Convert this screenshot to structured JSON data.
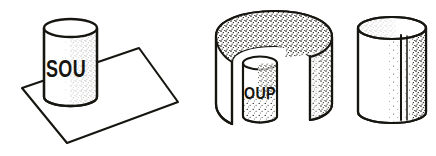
{
  "illustration": {
    "title": "Soup can label unwrapping sequence",
    "medium": "pen-and-ink line drawing with stipple shading",
    "background_color": "#ffffff",
    "ink_color": "#17150f",
    "canvas": {
      "width": 436,
      "height": 156
    },
    "figure_count": 3,
    "figures": [
      {
        "id": "figure-1",
        "name": "can-on-flat-sheet",
        "description": "Upright cylindrical can standing on a flat rectangular sheet shown in perspective",
        "label_text": "SOU",
        "parts": [
          {
            "name": "flat-sheet",
            "shape": "quadrilateral"
          },
          {
            "name": "can-body",
            "shape": "cylinder"
          },
          {
            "name": "can-top-ellipse",
            "shape": "ellipse"
          },
          {
            "name": "stipple-shading",
            "side": "right"
          }
        ],
        "bbox": {
          "x": 20,
          "y": 18,
          "width": 160,
          "height": 128
        }
      },
      {
        "id": "figure-2",
        "name": "label-peeled-open",
        "description": "Outer label curled open away from the inner cylinder, forming a C-shaped wrap with a gap",
        "label_text": "OUP",
        "parts": [
          {
            "name": "outer-label-wrap",
            "shape": "open-cylinder-band"
          },
          {
            "name": "label-top-rim",
            "shape": "ellipse-arc"
          },
          {
            "name": "inner-cylinder",
            "shape": "cylinder"
          },
          {
            "name": "left-label-flap",
            "shape": "curved-panel"
          },
          {
            "name": "right-label-flap",
            "shape": "curved-panel"
          },
          {
            "name": "stipple-shading",
            "side": "top-and-right"
          }
        ],
        "bbox": {
          "x": 213,
          "y": 12,
          "width": 122,
          "height": 124
        }
      },
      {
        "id": "figure-3",
        "name": "bare-cylinder-with-seam",
        "description": "Plain cylinder with a vertical seam line and stipple shading on the right side",
        "label_text": "",
        "parts": [
          {
            "name": "cylinder-body",
            "shape": "cylinder"
          },
          {
            "name": "cylinder-top-ellipse",
            "shape": "ellipse"
          },
          {
            "name": "vertical-seam-line",
            "shape": "line"
          },
          {
            "name": "stipple-shading",
            "side": "right"
          }
        ],
        "bbox": {
          "x": 355,
          "y": 14,
          "width": 72,
          "height": 118
        }
      }
    ]
  }
}
